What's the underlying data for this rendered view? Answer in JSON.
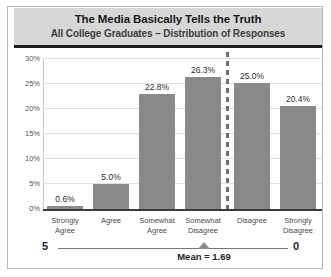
{
  "chart_data": {
    "type": "bar",
    "title": "The Media Basically Tells the Truth",
    "subtitle": "All College Graduates – Distribution of Responses",
    "categories": [
      "Strongly\nAgree",
      "Agree",
      "Somewhat\nAgree",
      "Somewhat\nDisagree",
      "Disagree",
      "Strongly\nDisagree"
    ],
    "values": [
      0.6,
      5.0,
      22.8,
      26.3,
      25.0,
      20.4
    ],
    "data_labels": [
      "0.6%",
      "5.0%",
      "22.8%",
      "26.3%",
      "25.0%",
      "20.4%"
    ],
    "xlabel": "",
    "ylabel": "",
    "ylim": [
      0,
      30
    ],
    "ytick_values": [
      0,
      5,
      10,
      15,
      20,
      25,
      30
    ],
    "ytick_labels": [
      "0%",
      "5%",
      "10%",
      "15%",
      "20%",
      "25%",
      "30%"
    ],
    "grid": true,
    "legend": false,
    "bar_color": "#8a8a8a",
    "annotations": {
      "divider_after_category_index": 3,
      "scale_left": "5",
      "scale_right": "0",
      "mean_label": "Mean = 1.69",
      "mean_value": 1.69
    }
  },
  "header": {
    "title": "The Media Basically Tells the Truth",
    "subtitle": "All College Graduates – Distribution of Responses",
    "band_color": "#d7d7d7"
  },
  "axis": {
    "yticks": [
      "30%",
      "25%",
      "20%",
      "15%",
      "10%",
      "5%",
      "0%"
    ]
  },
  "bars": [
    {
      "label": "0.6%",
      "value": 0.6,
      "category_line1": "Strongly",
      "category_line2": "Agree"
    },
    {
      "label": "5.0%",
      "value": 5.0,
      "category_line1": "Agree",
      "category_line2": ""
    },
    {
      "label": "22.8%",
      "value": 22.8,
      "category_line1": "Somewhat",
      "category_line2": "Agree"
    },
    {
      "label": "26.3%",
      "value": 26.3,
      "category_line1": "Somewhat",
      "category_line2": "Disagree"
    },
    {
      "label": "25.0%",
      "value": 25.0,
      "category_line1": "Disagree",
      "category_line2": ""
    },
    {
      "label": "20.4%",
      "value": 20.4,
      "category_line1": "Strongly",
      "category_line2": "Disagree"
    }
  ],
  "footer": {
    "scale_left": "5",
    "scale_right": "0",
    "mean_label": "Mean = 1.69"
  }
}
